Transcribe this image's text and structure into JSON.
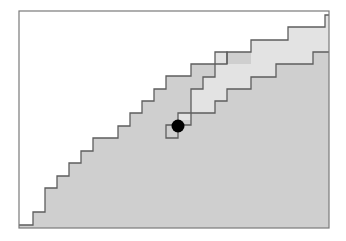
{
  "canvas": {
    "width": 346,
    "height": 241,
    "background": "#ffffff"
  },
  "colors": {
    "frame": "#7a7a7a",
    "line": "#5e5e5e",
    "region_fill": "#cfcfcf",
    "light_region_fill": "#e3e3e3",
    "dot": "#000000"
  },
  "frame": {
    "x": 19,
    "y": 11,
    "width": 310,
    "height": 217
  },
  "regions": {
    "shaded_region": {
      "description": "gray region below the outer staircase boundary",
      "points": [
        [
          19,
          228
        ],
        [
          19,
          225
        ],
        [
          33,
          225
        ],
        [
          33,
          212
        ],
        [
          45,
          212
        ],
        [
          45,
          188
        ],
        [
          57,
          188
        ],
        [
          57,
          176
        ],
        [
          69,
          176
        ],
        [
          69,
          163
        ],
        [
          81,
          163
        ],
        [
          81,
          151
        ],
        [
          93,
          151
        ],
        [
          93,
          138
        ],
        [
          118,
          138
        ],
        [
          118,
          126
        ],
        [
          130,
          126
        ],
        [
          130,
          113
        ],
        [
          142,
          113
        ],
        [
          142,
          101
        ],
        [
          154,
          101
        ],
        [
          154,
          89
        ],
        [
          166,
          89
        ],
        [
          166,
          76
        ],
        [
          191,
          76
        ],
        [
          191,
          64
        ],
        [
          227,
          64
        ],
        [
          227,
          52
        ],
        [
          251,
          52
        ],
        [
          251,
          40
        ],
        [
          288,
          40
        ],
        [
          288,
          27
        ],
        [
          325,
          27
        ],
        [
          325,
          15
        ],
        [
          329,
          15
        ],
        [
          329,
          228
        ]
      ]
    },
    "light_region": {
      "description": "lighter band bounded by the inner staircase path",
      "points": [
        [
          215,
          52
        ],
        [
          227,
          52
        ],
        [
          227,
          64
        ],
        [
          251,
          64
        ],
        [
          251,
          52
        ],
        [
          251,
          40
        ],
        [
          288,
          40
        ],
        [
          288,
          27
        ],
        [
          325,
          27
        ],
        [
          325,
          15
        ],
        [
          329,
          15
        ],
        [
          329,
          52
        ],
        [
          313,
          52
        ],
        [
          313,
          64
        ],
        [
          276,
          64
        ],
        [
          276,
          77
        ],
        [
          251,
          77
        ],
        [
          251,
          89
        ],
        [
          227,
          89
        ],
        [
          227,
          101
        ],
        [
          215,
          101
        ],
        [
          215,
          113
        ],
        [
          178,
          113
        ],
        [
          178,
          120
        ],
        [
          191,
          120
        ],
        [
          191,
          89
        ],
        [
          203,
          89
        ],
        [
          203,
          77
        ],
        [
          215,
          77
        ]
      ]
    }
  },
  "paths": {
    "outer_staircase": [
      [
        19,
        225
      ],
      [
        33,
        225
      ],
      [
        33,
        212
      ],
      [
        45,
        212
      ],
      [
        45,
        188
      ],
      [
        57,
        188
      ],
      [
        57,
        176
      ],
      [
        69,
        176
      ],
      [
        69,
        163
      ],
      [
        81,
        163
      ],
      [
        81,
        151
      ],
      [
        93,
        151
      ],
      [
        93,
        138
      ],
      [
        118,
        138
      ],
      [
        118,
        126
      ],
      [
        130,
        126
      ],
      [
        130,
        113
      ],
      [
        142,
        113
      ],
      [
        142,
        101
      ],
      [
        154,
        101
      ],
      [
        154,
        89
      ],
      [
        166,
        89
      ],
      [
        166,
        76
      ],
      [
        191,
        76
      ],
      [
        191,
        64
      ],
      [
        227,
        64
      ],
      [
        227,
        52
      ],
      [
        251,
        52
      ],
      [
        251,
        40
      ],
      [
        288,
        40
      ],
      [
        288,
        27
      ],
      [
        325,
        27
      ],
      [
        325,
        15
      ],
      [
        329,
        15
      ]
    ],
    "inner_path": [
      [
        227,
        64
      ],
      [
        227,
        52
      ],
      [
        215,
        52
      ],
      [
        215,
        77
      ],
      [
        203,
        77
      ],
      [
        203,
        89
      ],
      [
        191,
        89
      ],
      [
        191,
        125
      ],
      [
        178,
        125
      ],
      [
        178,
        138
      ],
      [
        166,
        138
      ],
      [
        166,
        125
      ],
      [
        178,
        125
      ],
      [
        178,
        113
      ],
      [
        215,
        113
      ],
      [
        215,
        101
      ],
      [
        227,
        101
      ],
      [
        227,
        89
      ],
      [
        251,
        89
      ],
      [
        251,
        77
      ],
      [
        276,
        77
      ],
      [
        276,
        64
      ],
      [
        313,
        64
      ],
      [
        313,
        52
      ],
      [
        329,
        52
      ]
    ]
  },
  "marker": {
    "name": "current-position",
    "cx": 178,
    "cy": 126,
    "r": 6.5
  }
}
